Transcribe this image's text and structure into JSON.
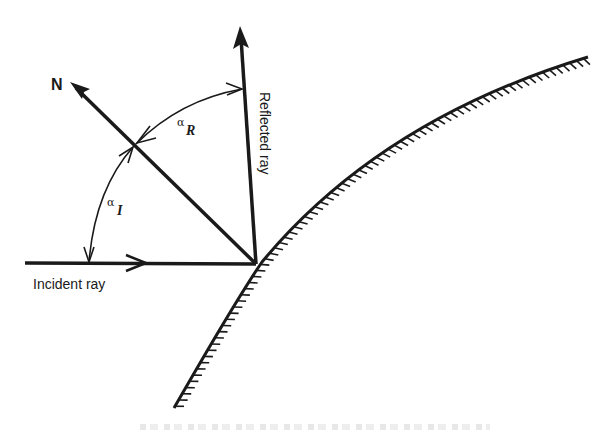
{
  "diagram": {
    "type": "reflection-geometry",
    "labels": {
      "normal": "N",
      "incident_ray": "Incident ray",
      "reflected_ray": "Reflected ray",
      "angle_incidence_symbol": "α",
      "angle_incidence_subscript": "I",
      "angle_reflection_symbol": "α",
      "angle_reflection_subscript": "R"
    },
    "elements": {
      "reflection_point": [
        256,
        264
      ],
      "normal_tip": [
        72,
        84
      ],
      "reflected_tip": [
        240,
        27
      ],
      "incident_start": [
        25,
        263
      ],
      "surface_start": [
        174,
        408
      ],
      "surface_end": [
        588,
        57
      ]
    },
    "colors": {
      "ink": "#1a1a1a",
      "background": "#ffffff"
    }
  }
}
